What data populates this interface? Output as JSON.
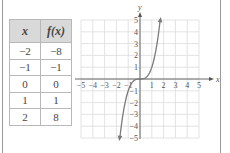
{
  "table": {
    "headers": [
      "x",
      "f(x)"
    ],
    "rows": [
      [
        "−2",
        "−8"
      ],
      [
        "−1",
        "−1"
      ],
      [
        "0",
        "0"
      ],
      [
        "1",
        "1"
      ],
      [
        "2",
        "8"
      ]
    ]
  },
  "chart_data": {
    "type": "line",
    "title": "",
    "function": "f(x) = x^3",
    "x": [
      -2,
      -1,
      0,
      1,
      2
    ],
    "series": [
      {
        "name": "f(x)",
        "values": [
          -8,
          -1,
          0,
          1,
          8
        ]
      }
    ],
    "xlabel": "x",
    "ylabel": "y",
    "xlim": [
      -5,
      5
    ],
    "ylim": [
      -5,
      5
    ],
    "x_ticks": [
      "−5",
      "−4",
      "−3",
      "−2",
      "−1",
      "1",
      "2",
      "3",
      "4",
      "5"
    ],
    "y_ticks": [
      "5",
      "4",
      "3",
      "2",
      "1",
      "−1",
      "−2",
      "−3",
      "−4",
      "−5"
    ],
    "grid": true,
    "curve_color": "#7a7a7a"
  }
}
